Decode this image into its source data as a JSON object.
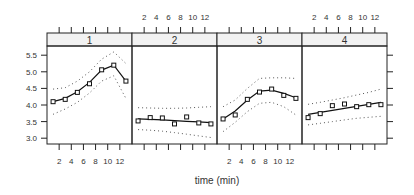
{
  "chart_data": {
    "type": "line",
    "title": "",
    "xlabel": "time (min)",
    "ylabel": "",
    "layout": "1x4 lattice panels",
    "panels": [
      "1",
      "2",
      "3",
      "4"
    ],
    "x": [
      1,
      3,
      5,
      7,
      9,
      11,
      13
    ],
    "x_ticks": [
      2,
      4,
      6,
      8,
      10,
      12
    ],
    "x_tick_labels": [
      "2",
      "4",
      "6",
      "8",
      "10",
      "12"
    ],
    "y_ticks": [
      3.0,
      3.5,
      4.0,
      4.5,
      5.0,
      5.5
    ],
    "y_tick_labels": [
      "3.0",
      "3.5",
      "4.0",
      "4.5",
      "5.0",
      "5.5"
    ],
    "ylim": [
      2.9,
      5.8
    ],
    "xlim": [
      0,
      14
    ],
    "grid": false,
    "series": [
      {
        "name": "1",
        "values": [
          4.1,
          4.17,
          4.38,
          4.64,
          5.06,
          5.2,
          4.72
        ],
        "fit": [
          4.1,
          4.2,
          4.4,
          4.68,
          5.05,
          5.2,
          4.72
        ],
        "upper": [
          4.48,
          4.52,
          4.72,
          5.0,
          5.38,
          5.6,
          5.25
        ],
        "lower": [
          3.72,
          3.88,
          4.08,
          4.36,
          4.72,
          4.88,
          4.2
        ]
      },
      {
        "name": "2",
        "values": [
          3.52,
          3.62,
          3.61,
          3.43,
          3.64,
          3.46,
          3.43
        ],
        "fit": [
          3.58,
          3.57,
          3.55,
          3.53,
          3.51,
          3.49,
          3.47
        ],
        "upper": [
          3.92,
          3.91,
          3.9,
          3.9,
          3.91,
          3.93,
          3.95
        ],
        "lower": [
          3.26,
          3.24,
          3.21,
          3.17,
          3.12,
          3.07,
          3.02
        ]
      },
      {
        "name": "3",
        "values": [
          3.58,
          3.7,
          4.17,
          4.39,
          4.48,
          4.29,
          4.2
        ],
        "fit": [
          3.58,
          3.82,
          4.15,
          4.42,
          4.45,
          4.35,
          4.22
        ],
        "upper": [
          3.95,
          4.15,
          4.5,
          4.8,
          4.82,
          4.82,
          4.8
        ],
        "lower": [
          3.2,
          3.48,
          3.8,
          4.05,
          4.08,
          3.95,
          3.7
        ]
      },
      {
        "name": "4",
        "values": [
          3.62,
          3.74,
          3.98,
          4.03,
          3.95,
          4.01,
          4.01
        ],
        "fit": [
          3.72,
          3.78,
          3.84,
          3.9,
          3.96,
          4.02,
          4.08
        ],
        "upper": [
          4.02,
          4.08,
          4.15,
          4.22,
          4.3,
          4.38,
          4.48
        ],
        "lower": [
          3.4,
          3.45,
          3.5,
          3.55,
          3.6,
          3.63,
          3.66
        ]
      }
    ]
  },
  "colors": {
    "axis": "#222222",
    "strip": "#f2f2f2",
    "line": "#111111",
    "band": "#555555"
  }
}
